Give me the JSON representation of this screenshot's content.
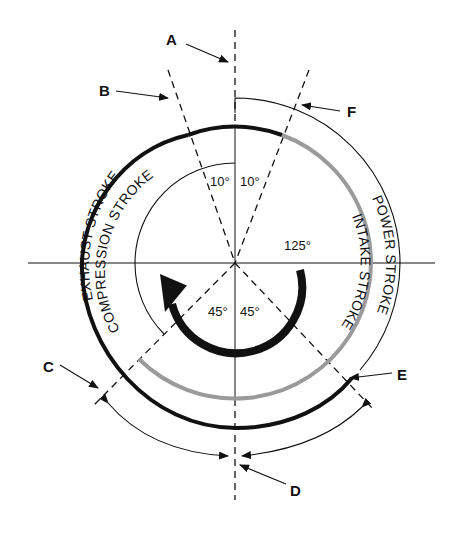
{
  "diagram": {
    "colors": {
      "line": "#111111",
      "intake_arc": "#9a9a9a",
      "exhaust_arc": "#111111",
      "background": "#ffffff"
    },
    "callouts": {
      "A": "A",
      "B": "B",
      "C": "C",
      "D": "D",
      "E": "E",
      "F": "F"
    },
    "angles": {
      "top_left": "10°",
      "top_right": "10°",
      "bottom_left": "45°",
      "bottom_right": "45°",
      "power_end": "125°"
    },
    "strokes": {
      "exhaust": "EXHAUST STROKE",
      "compression": "COMPRESSION STROKE",
      "intake": "INTAKE STROKE",
      "power": "POWER STROKE"
    },
    "rotation_arrow": "rotation-direction-arrow"
  }
}
